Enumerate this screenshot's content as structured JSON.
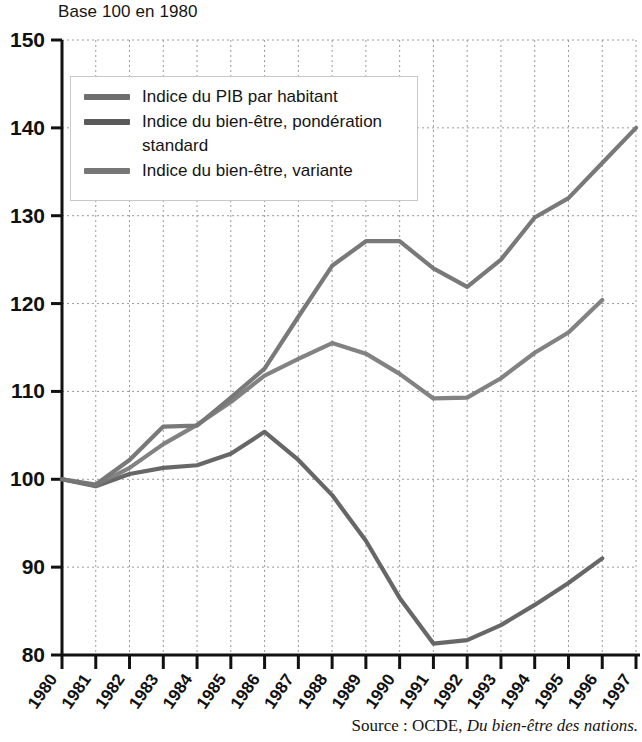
{
  "figure": {
    "axis_title": "Base 100 en 1980",
    "source_prefix": "Source : OCDE,",
    "source_work": "Du bien-être des nations."
  },
  "legend": {
    "items": [
      {
        "label": "Indice du PIB par habitant",
        "color": "#6e6e6e"
      },
      {
        "label": "Indice du bien-être, pondération\nstandard",
        "color": "#5a5a5a"
      },
      {
        "label": "Indice du bien-être, variante",
        "color": "#777777"
      }
    ]
  },
  "chart_data": {
    "type": "line",
    "title": "Base 100 en 1980",
    "xlabel": "",
    "ylabel": "Base 100 en 1980",
    "xlim": [
      1980,
      1997
    ],
    "ylim": [
      80,
      150
    ],
    "yticks": [
      80,
      90,
      100,
      110,
      120,
      130,
      140,
      150
    ],
    "grid": true,
    "legend_position": "upper-left",
    "x": [
      1980,
      1981,
      1982,
      1983,
      1984,
      1985,
      1986,
      1987,
      1988,
      1989,
      1990,
      1991,
      1992,
      1993,
      1994,
      1995,
      1996,
      1997
    ],
    "categories": [
      "1980",
      "1981",
      "1982",
      "1983",
      "1984",
      "1985",
      "1986",
      "1987",
      "1988",
      "1989",
      "1990",
      "1991",
      "1992",
      "1993",
      "1994",
      "1995",
      "1996",
      "1997"
    ],
    "series": [
      {
        "name": "Indice du PIB par habitant",
        "color": "#6e6e6e",
        "values": [
          100.0,
          99.4,
          102.2,
          106.0,
          106.1,
          109.3,
          112.6,
          118.5,
          124.3,
          127.1,
          127.1,
          124.0,
          121.9,
          125.0,
          129.8,
          132.0,
          136.0,
          140.0
        ]
      },
      {
        "name": "Indice du bien-être, pondération standard",
        "color": "#5a5a5a",
        "values": [
          100.0,
          99.2,
          100.6,
          101.3,
          101.6,
          102.9,
          105.4,
          102.2,
          98.2,
          93.0,
          86.5,
          81.3,
          81.7,
          83.4,
          85.7,
          88.2,
          91.0,
          null
        ]
      },
      {
        "name": "Indice du bien-être, variante",
        "color": "#777777",
        "values": [
          100.0,
          99.3,
          101.3,
          104.0,
          106.2,
          108.8,
          111.8,
          113.7,
          115.5,
          114.3,
          112.0,
          109.2,
          109.3,
          111.5,
          114.4,
          116.7,
          120.4,
          null
        ]
      }
    ]
  },
  "plot_geometry": {
    "left": 62,
    "right": 636,
    "top": 40,
    "bottom": 655
  }
}
